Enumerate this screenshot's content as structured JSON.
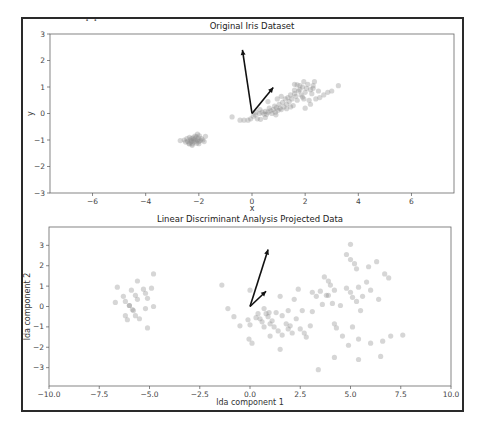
{
  "header": {
    "cut_text": "·  ·"
  },
  "chart_data": [
    {
      "type": "scatter",
      "title": "Original Iris Dataset",
      "xlabel": "x",
      "ylabel": "y",
      "xlim": [
        -7.6,
        7.6
      ],
      "ylim": [
        -3,
        3
      ],
      "xticks": [
        -6,
        -4,
        -2,
        0,
        2,
        4,
        6
      ],
      "yticks": [
        -3,
        -2,
        -1,
        0,
        1,
        2,
        3
      ],
      "grid": false,
      "arrows": [
        {
          "from": [
            0,
            0
          ],
          "to": [
            -0.36,
            2.4
          ]
        },
        {
          "from": [
            0,
            0
          ],
          "to": [
            0.8,
            0.98
          ]
        }
      ],
      "points": [
        [
          -2.7,
          -1.02
        ],
        [
          -2.55,
          -1.0
        ],
        [
          -2.5,
          -1.08
        ],
        [
          -2.45,
          -0.95
        ],
        [
          -2.42,
          -1.05
        ],
        [
          -2.38,
          -1.12
        ],
        [
          -2.35,
          -0.9
        ],
        [
          -2.32,
          -1.0
        ],
        [
          -2.3,
          -1.08
        ],
        [
          -2.28,
          -0.95
        ],
        [
          -2.26,
          -1.03
        ],
        [
          -2.25,
          -1.15
        ],
        [
          -2.22,
          -0.92
        ],
        [
          -2.2,
          -1.0
        ],
        [
          -2.18,
          -1.08
        ],
        [
          -2.15,
          -0.96
        ],
        [
          -2.12,
          -1.04
        ],
        [
          -2.1,
          -0.88
        ],
        [
          -2.08,
          -1.12
        ],
        [
          -2.05,
          -1.0
        ],
        [
          -2.02,
          -0.93
        ],
        [
          -2.0,
          -1.06
        ],
        [
          -1.98,
          -0.84
        ],
        [
          -1.95,
          -1.02
        ],
        [
          -1.9,
          -0.95
        ],
        [
          -1.85,
          -1.0
        ],
        [
          -1.8,
          -1.06
        ],
        [
          -2.05,
          -0.78
        ],
        [
          -2.15,
          -0.85
        ],
        [
          -2.25,
          -1.2
        ],
        [
          -1.75,
          -0.86
        ],
        [
          -2.35,
          -1.15
        ],
        [
          -2.0,
          -1.14
        ],
        [
          -0.75,
          -0.13
        ],
        [
          -0.45,
          -0.25
        ],
        [
          -0.3,
          -0.25
        ],
        [
          -0.15,
          -0.25
        ],
        [
          -0.05,
          -0.2
        ],
        [
          0.05,
          -0.1
        ],
        [
          0.12,
          -0.05
        ],
        [
          0.2,
          -0.2
        ],
        [
          0.28,
          0.0
        ],
        [
          0.32,
          -0.22
        ],
        [
          0.38,
          0.05
        ],
        [
          0.45,
          -0.02
        ],
        [
          0.5,
          0.08
        ],
        [
          0.55,
          -0.03
        ],
        [
          0.6,
          0.05
        ],
        [
          0.65,
          0.2
        ],
        [
          0.7,
          0.1
        ],
        [
          0.75,
          0.0
        ],
        [
          0.8,
          0.15
        ],
        [
          0.85,
          0.28
        ],
        [
          0.88,
          0.05
        ],
        [
          0.92,
          0.22
        ],
        [
          0.98,
          0.12
        ],
        [
          1.02,
          0.35
        ],
        [
          1.05,
          0.2
        ],
        [
          1.1,
          0.15
        ],
        [
          1.15,
          0.42
        ],
        [
          1.2,
          0.25
        ],
        [
          1.25,
          0.55
        ],
        [
          1.3,
          0.35
        ],
        [
          1.35,
          0.6
        ],
        [
          1.4,
          0.45
        ],
        [
          1.45,
          0.7
        ],
        [
          1.5,
          0.55
        ],
        [
          1.55,
          0.3
        ],
        [
          1.6,
          0.75
        ],
        [
          1.65,
          0.65
        ],
        [
          1.7,
          0.5
        ],
        [
          1.75,
          0.85
        ],
        [
          1.8,
          0.9
        ],
        [
          1.85,
          0.7
        ],
        [
          1.9,
          1.0
        ],
        [
          1.95,
          0.55
        ],
        [
          2.0,
          0.8
        ],
        [
          2.05,
          0.95
        ],
        [
          2.1,
          1.1
        ],
        [
          2.15,
          0.5
        ],
        [
          2.2,
          0.9
        ],
        [
          2.25,
          0.75
        ],
        [
          2.3,
          1.05
        ],
        [
          2.35,
          1.2
        ],
        [
          2.4,
          0.55
        ],
        [
          2.5,
          0.85
        ],
        [
          2.55,
          0.6
        ],
        [
          2.7,
          0.7
        ],
        [
          2.85,
          0.8
        ],
        [
          3.0,
          0.85
        ],
        [
          3.25,
          1.05
        ],
        [
          1.6,
          1.1
        ],
        [
          1.8,
          1.05
        ],
        [
          2.0,
          0.2
        ],
        [
          2.2,
          0.35
        ],
        [
          0.6,
          0.45
        ],
        [
          1.95,
          1.2
        ],
        [
          2.3,
          0.95
        ],
        [
          0.95,
          0.55
        ],
        [
          1.1,
          0.65
        ],
        [
          1.6,
          0.88
        ],
        [
          1.9,
          0.62
        ],
        [
          0.3,
          0.15
        ],
        [
          0.5,
          -0.15
        ],
        [
          0.15,
          0.05
        ],
        [
          0.9,
          -0.05
        ],
        [
          1.3,
          0.18
        ],
        [
          1.45,
          0.25
        ],
        [
          1.7,
          1.08
        ]
      ]
    },
    {
      "type": "scatter",
      "title": "Linear Discriminant Analysis Projected Data",
      "xlabel": "lda component 1",
      "ylabel": "lda component 2",
      "xlim": [
        -10,
        10
      ],
      "ylim": [
        -3.9,
        3.9
      ],
      "xticks": [
        -10.0,
        -7.5,
        -5.0,
        -2.5,
        0.0,
        2.5,
        5.0,
        7.5,
        10.0
      ],
      "xtick_labels": [
        "−10.0",
        "−7.5",
        "−5.0",
        "−2.5",
        "0.0",
        "2.5",
        "5.0",
        "7.5",
        "10.0"
      ],
      "yticks": [
        -3,
        -2,
        -1,
        0,
        1,
        2,
        3
      ],
      "grid": false,
      "arrows": [
        {
          "from": [
            0,
            0
          ],
          "to": [
            0.9,
            2.8
          ]
        },
        {
          "from": [
            0,
            0
          ],
          "to": [
            0.8,
            0.75
          ]
        }
      ],
      "points": [
        [
          -6.6,
          0.95
        ],
        [
          -6.7,
          0.2
        ],
        [
          -6.3,
          0.5
        ],
        [
          -6.2,
          0.25
        ],
        [
          -6.2,
          -0.45
        ],
        [
          -6.0,
          0.05
        ],
        [
          -6.1,
          -0.65
        ],
        [
          -5.9,
          0.8
        ],
        [
          -5.8,
          -0.2
        ],
        [
          -5.7,
          0.55
        ],
        [
          -5.7,
          -0.45
        ],
        [
          -5.6,
          1.25
        ],
        [
          -5.6,
          0.35
        ],
        [
          -5.5,
          -0.6
        ],
        [
          -5.3,
          0.85
        ],
        [
          -5.2,
          0.65
        ],
        [
          -5.2,
          -0.1
        ],
        [
          -5.1,
          0.4
        ],
        [
          -5.1,
          -1.05
        ],
        [
          -4.9,
          0.9
        ],
        [
          -4.8,
          1.6
        ],
        [
          -4.8,
          0.0
        ],
        [
          -6.0,
          0.05
        ],
        [
          -5.85,
          -0.15
        ],
        [
          -1.4,
          1.05
        ],
        [
          -1.1,
          -0.1
        ],
        [
          -0.8,
          -0.5
        ],
        [
          -0.5,
          -0.95
        ],
        [
          -0.1,
          -0.65
        ],
        [
          -0.05,
          -1.6
        ],
        [
          0.0,
          0.8
        ],
        [
          0.0,
          -0.9
        ],
        [
          0.1,
          -1.8
        ],
        [
          0.4,
          -0.35
        ],
        [
          0.5,
          -0.6
        ],
        [
          0.7,
          -0.1
        ],
        [
          0.7,
          -1.0
        ],
        [
          0.8,
          -0.35
        ],
        [
          0.9,
          -0.5
        ],
        [
          1.0,
          -1.45
        ],
        [
          1.1,
          -0.7
        ],
        [
          1.2,
          -1.0
        ],
        [
          1.4,
          -1.2
        ],
        [
          1.5,
          0.5
        ],
        [
          1.5,
          -2.1
        ],
        [
          1.6,
          -0.45
        ],
        [
          1.6,
          -1.4
        ],
        [
          1.8,
          -0.85
        ],
        [
          1.9,
          -1.1
        ],
        [
          1.9,
          -0.2
        ],
        [
          2.1,
          -1.3
        ],
        [
          2.2,
          0.35
        ],
        [
          2.3,
          -0.6
        ],
        [
          2.4,
          0.85
        ],
        [
          2.5,
          -1.1
        ],
        [
          2.6,
          -0.2
        ],
        [
          2.7,
          -1.3
        ],
        [
          2.8,
          -1.5
        ],
        [
          3.0,
          -0.95
        ],
        [
          3.1,
          0.7
        ],
        [
          3.1,
          -0.25
        ],
        [
          3.3,
          0.5
        ],
        [
          3.4,
          -3.1
        ],
        [
          3.5,
          0.75
        ],
        [
          3.6,
          0.1
        ],
        [
          3.7,
          1.45
        ],
        [
          3.8,
          0.55
        ],
        [
          3.9,
          1.25
        ],
        [
          4.0,
          1.05
        ],
        [
          4.1,
          0.15
        ],
        [
          4.2,
          0.8
        ],
        [
          4.2,
          -0.85
        ],
        [
          4.2,
          -2.5
        ],
        [
          4.3,
          -1.05
        ],
        [
          4.6,
          -1.45
        ],
        [
          4.8,
          2.55
        ],
        [
          4.8,
          0.9
        ],
        [
          4.9,
          -1.9
        ],
        [
          5.0,
          3.05
        ],
        [
          5.0,
          2.3
        ],
        [
          5.0,
          0.7
        ],
        [
          5.1,
          0.45
        ],
        [
          5.2,
          2.1
        ],
        [
          5.3,
          1.85
        ],
        [
          5.3,
          0.25
        ],
        [
          5.4,
          0.95
        ],
        [
          5.4,
          -1.6
        ],
        [
          5.4,
          -2.6
        ],
        [
          5.5,
          -0.2
        ],
        [
          5.6,
          0.5
        ],
        [
          5.8,
          1.2
        ],
        [
          5.9,
          1.95
        ],
        [
          6.0,
          -1.8
        ],
        [
          6.0,
          0.8
        ],
        [
          6.3,
          2.2
        ],
        [
          6.4,
          0.35
        ],
        [
          6.5,
          -2.45
        ],
        [
          6.6,
          -1.7
        ],
        [
          6.7,
          1.6
        ],
        [
          6.9,
          1.4
        ],
        [
          7.0,
          -1.45
        ],
        [
          7.6,
          -1.4
        ],
        [
          0.3,
          -0.55
        ],
        [
          1.0,
          -0.85
        ],
        [
          2.0,
          -0.95
        ],
        [
          4.5,
          0.05
        ],
        [
          0.95,
          -0.3
        ],
        [
          1.3,
          -0.3
        ],
        [
          5.1,
          -1.0
        ],
        [
          3.9,
          0.55
        ],
        [
          0.6,
          -0.75
        ]
      ]
    }
  ]
}
